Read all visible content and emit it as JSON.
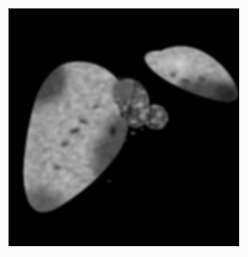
{
  "viewer": {
    "name": "specimen-image-viewer",
    "width": 248,
    "height": 257,
    "background_color": "#fbfbfb",
    "canvas_color": "#010101",
    "modality": "grayscale-anatomical-specimen-photograph",
    "alt_text": "Grayscale photograph of a dissected two-lobed organ specimen on a black background"
  },
  "specimen": {
    "label": "",
    "description": "Two-lobed organ specimen with nodular structures at the hilum",
    "tone_min": "#000000",
    "tone_max": "#f2f2f2",
    "parts": [
      {
        "id": "left-lobe",
        "name": "large-left-lobe",
        "bbox": [
          25,
          55,
          103,
          158
        ],
        "mean_tone": "#6a6a6a"
      },
      {
        "id": "right-lobe",
        "name": "tapered-right-lobe",
        "bbox": [
          143,
          47,
          94,
          55
        ],
        "mean_tone": "#7d7d7d"
      },
      {
        "id": "hilar-nodules",
        "name": "nodular-hilar-cluster",
        "bbox": [
          113,
          82,
          56,
          38
        ],
        "mean_tone": "#9a9a9a"
      }
    ],
    "highlights": [
      {
        "id": "h1",
        "cx": 171,
        "cy": 61,
        "r": 12,
        "tone": "#e8e8e8"
      },
      {
        "id": "h2",
        "cx": 93,
        "cy": 126,
        "r": 10,
        "tone": "#dcdcdc"
      },
      {
        "id": "h3",
        "cx": 57,
        "cy": 171,
        "r": 9,
        "tone": "#c8c8c8"
      },
      {
        "id": "h4",
        "cx": 131,
        "cy": 97,
        "r": 7,
        "tone": "#d2d2d2"
      }
    ]
  },
  "frame": {
    "top_rule_color": "#6e6e6e",
    "left_rule_color": "#8a8a8a",
    "right_rule_color": "#d8d8d8",
    "bottom_rule_color": "#dcdcdc"
  }
}
